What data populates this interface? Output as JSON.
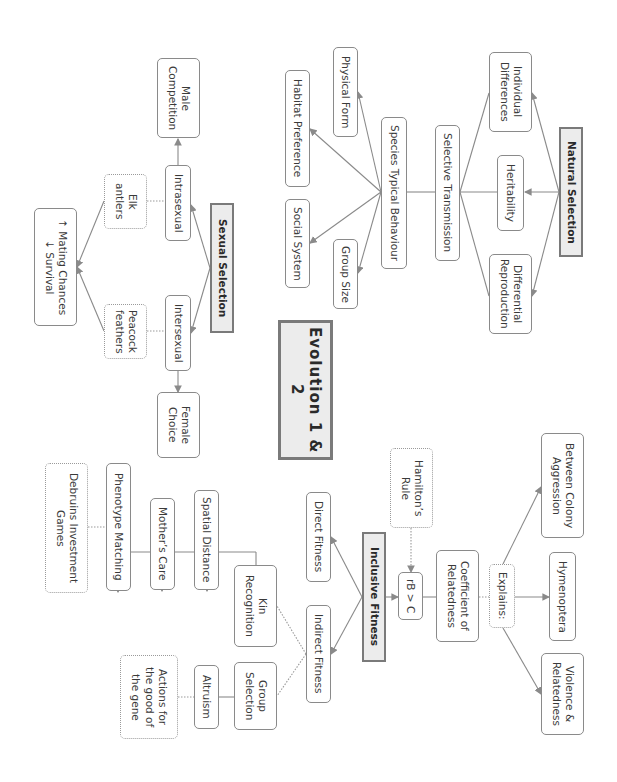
{
  "title": "Evolution 1 & 2",
  "colors": {
    "border": "#8a8a8a",
    "header_fill": "#ececec",
    "line": "#8a8a8a",
    "text": "#3a3a3a"
  },
  "natural_selection": {
    "header": "Natural Selection",
    "individual_differences": "Individual\nDifferences",
    "heritability": "Heritability",
    "differential_reproduction": "Differential\nReproduction",
    "selective_transmission": "Selective Transmission",
    "species_typical_behaviour": "Species Typical Behaviour",
    "physical_form": "Physical Form",
    "habitat_preference": "Habitat Preference",
    "social_system": "Social System",
    "group_size": "Group Size"
  },
  "sexual_selection": {
    "header": "Sexual Selection",
    "male_competition": "Male\nCompetition",
    "intrasexual": "Intrasexual",
    "elk_antlers": "Elk\nantlers",
    "intersexual": "Intersexual",
    "peacock_feathers": "Peacock\nfeathers",
    "mating_survival": "↑ Mating Chances\n↓ Survival",
    "female_choice": "Female\nChoice"
  },
  "inclusive_fitness": {
    "header": "Inclusive Fitness",
    "hamiltons_rule": "Hamilton’s\nRule",
    "rule_formula": "rB > C",
    "coefficient_of_relatedness": "Coefficient of\nRelatedness",
    "explains": "Explains:",
    "between_colony_aggression": "Between Colony\nAggression",
    "hymenoptera": "Hymenoptera",
    "violence_relatedness": "Violence &\nRelatedness",
    "direct_fitness": "Direct Fitness",
    "indirect_fitness": "Indirect Fitness",
    "kin_recognition": "Kin\nRecognition",
    "group_selection": "Group\nSelection",
    "spatial_distance": "Spatial Distance",
    "mothers_care": "Mother’s Care",
    "phenotype_matching": "Phenotype Matching",
    "debruins_games": "Debruins Investment\nGames",
    "altruism": "Altruism",
    "actions_gene": "Actions for\nthe good of\nthe gene"
  }
}
